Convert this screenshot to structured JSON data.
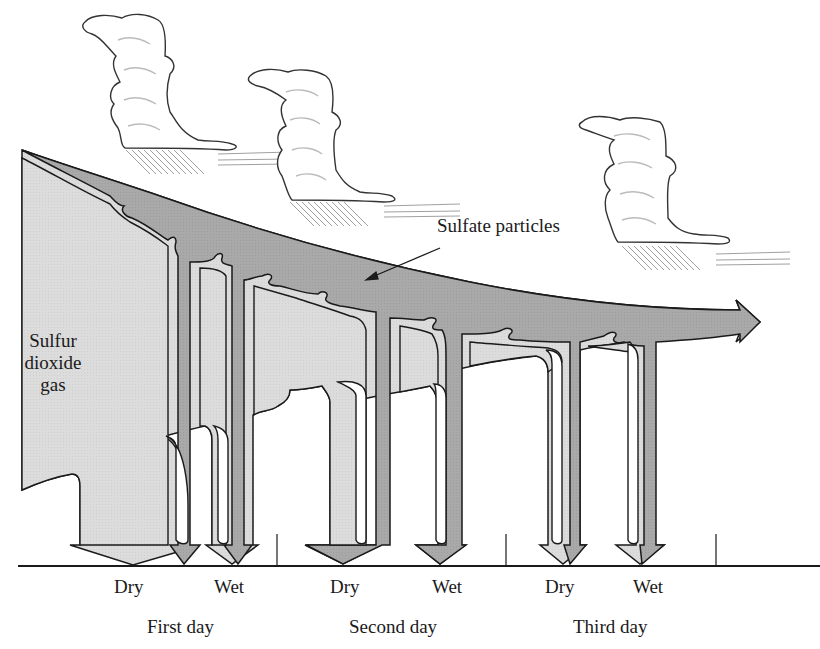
{
  "diagram": {
    "labels": {
      "sulfur_dioxide_gas": [
        "Sulfur",
        "dioxide",
        "gas"
      ],
      "sulfate_particles": "Sulfate particles"
    },
    "days": [
      {
        "label": "First day",
        "deposition": [
          "Dry",
          "Wet"
        ]
      },
      {
        "label": "Second day",
        "deposition": [
          "Dry",
          "Wet"
        ]
      },
      {
        "label": "Third day",
        "deposition": [
          "Dry",
          "Wet"
        ]
      }
    ],
    "icons": [
      "cloud-icon",
      "cloud-icon",
      "cloud-icon",
      "rain-icon"
    ],
    "colors": {
      "gas_fill": "#dcdcdc",
      "particles_fill": "#a9a9a9",
      "outline": "#1a1a1a",
      "background": "#ffffff"
    }
  }
}
